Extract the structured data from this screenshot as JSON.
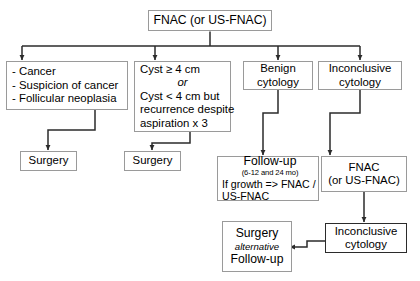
{
  "diagram": {
    "stroke_color": "#2b2b2b",
    "box_border_color": "#9a9a9a",
    "background": "#ffffff"
  },
  "nodes": {
    "root": {
      "line1": "FNAC (or US-FNAC)"
    },
    "malignant": {
      "line1": "- Cancer",
      "line2": "- Suspicion of cancer",
      "line3": "- Follicular neoplasia"
    },
    "cyst": {
      "line1": "Cyst ≥ 4 cm",
      "line2": "or",
      "line3": "Cyst < 4 cm but",
      "line4": "recurrence despite",
      "line5": "aspiration  x 3"
    },
    "benign": {
      "line1": "Benign",
      "line2": "cytology"
    },
    "inconclusive": {
      "line1": "Inconclusive",
      "line2": "cytology"
    },
    "surgery_left": {
      "line1": "Surgery"
    },
    "surgery_cyst": {
      "line1": "Surgery"
    },
    "followup": {
      "line1": "Follow-up",
      "line2": "(6-12 and 24 mo)",
      "line3": "If growth => FNAC /",
      "line4": "US-FNAC"
    },
    "fnac_repeat": {
      "line1": "FNAC",
      "line2": "(or US-FNAC)"
    },
    "inconclusive2": {
      "line1": "Inconclusive",
      "line2": "cytology"
    },
    "surgery_alt": {
      "line1": "Surgery",
      "line2": "alternative",
      "line3": "Follow-up"
    }
  }
}
